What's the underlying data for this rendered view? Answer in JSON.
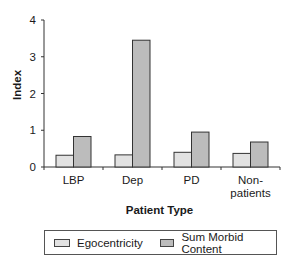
{
  "chart_data": {
    "type": "bar",
    "title": "",
    "xlabel": "Patient Type",
    "ylabel": "Index",
    "ylim": [
      0,
      4
    ],
    "yticks": [
      0,
      1,
      2,
      3,
      4
    ],
    "grid": false,
    "legend_position": "bottom",
    "categories": [
      "LBP",
      "Dep",
      "PD",
      "Non-\npatients"
    ],
    "series": [
      {
        "name": "Egocentricity",
        "color": "#e2e2e2",
        "values": [
          0.32,
          0.33,
          0.4,
          0.37
        ]
      },
      {
        "name": "Sum Morbid Content",
        "color": "#bcbcbc",
        "values": [
          0.83,
          3.45,
          0.95,
          0.68
        ]
      }
    ]
  },
  "labels": {
    "xlabel": "Patient Type",
    "ylabel": "Index",
    "legend": [
      "Egocentricity",
      "Sum Morbid Content"
    ]
  }
}
